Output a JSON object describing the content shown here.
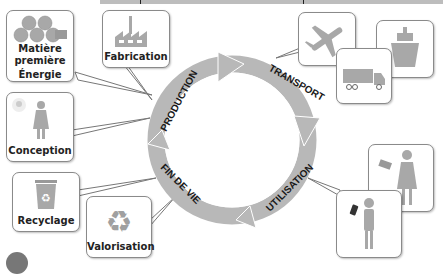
{
  "diagram": {
    "cycle_stages": [
      {
        "label": "PRODUCTION"
      },
      {
        "label": "TRANSPORT"
      },
      {
        "label": "UTILISATION"
      },
      {
        "label": "FIN DE VIE"
      }
    ],
    "boxes": {
      "matiere": {
        "line1": "Matière",
        "line2": "première",
        "line3": "Énergie",
        "icon": "logs-icon"
      },
      "fabrication": {
        "label": "Fabrication",
        "icon": "factory-icon"
      },
      "conception": {
        "label": "Conception",
        "icon": "person-lightbulb-icon"
      },
      "transport_plane": {
        "icon": "airplane-icon"
      },
      "transport_truck": {
        "icon": "truck-icon"
      },
      "transport_ship": {
        "icon": "ship-icon"
      },
      "utilisation_tablet": {
        "icon": "person-tablet-icon"
      },
      "utilisation_phone": {
        "icon": "person-phone-icon"
      },
      "recyclage": {
        "label": "Recyclage",
        "icon": "recycle-bin-icon"
      },
      "valorisation": {
        "label": "Valorisation",
        "icon": "recycle-arrows-icon"
      }
    },
    "colors": {
      "ring": "#b8b8b8",
      "border": "#8a8a8a",
      "icon": "#a8a8a8",
      "text": "#222222"
    }
  }
}
